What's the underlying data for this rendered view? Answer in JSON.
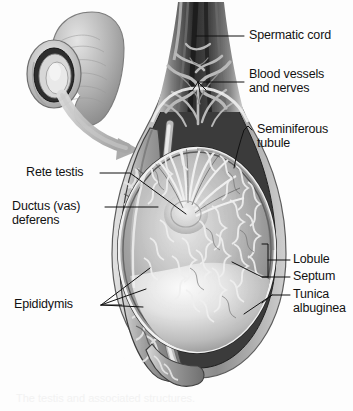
{
  "figure": {
    "background_color": "#fdfdfd",
    "ink_color": "#121212",
    "inset": {
      "name": "penis-and-scrotum-orientation-inset",
      "description": "Small grayscale drawing of penis and scrotum with a curved arrow pointing to the enlarged sagittal section"
    },
    "caption_text": "The testis and associated structures."
  },
  "labels": {
    "spermatic_cord": "Spermatic cord",
    "blood_vessels_line1": "Blood vessels",
    "blood_vessels_line2": "and nerves",
    "seminiferous_line1": "Seminiferous",
    "seminiferous_line2": "tubule",
    "rete_testis": "Rete testis",
    "ductus_line1": "Ductus (vas)",
    "ductus_line2": "deferens",
    "epididymis": "Epididymis",
    "lobule": "Lobule",
    "septum": "Septum",
    "tunica_line1": "Tunica",
    "tunica_line2": "albuginea"
  },
  "colors": {
    "tissue_dark": "#3a3a3a",
    "tissue_mid": "#8d8d8d",
    "tissue_light": "#c8c8c8",
    "tissue_highlight": "#ececec",
    "outline": "#1a1a1a",
    "leader_line": "#111111"
  }
}
